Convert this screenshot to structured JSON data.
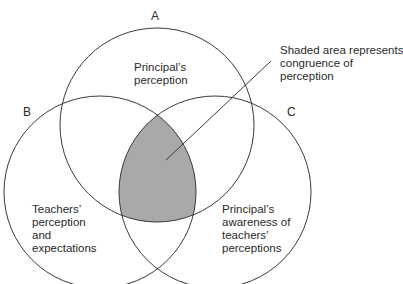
{
  "circles": {
    "a": {
      "letter": "A",
      "label": "Principal’s\nperception"
    },
    "b": {
      "letter": "B",
      "label": "Teachers’\nperception\nand\nexpectations"
    },
    "c": {
      "letter": "C",
      "label": "Principal’s\nawareness of\nteachers’\nperceptions"
    }
  },
  "annotation": {
    "text": "Shaded area represents\ncongruence of\nperception"
  },
  "colors": {
    "stroke": "#3a3a3a",
    "shade": "#a9a9a9",
    "background": "#ffffff"
  }
}
